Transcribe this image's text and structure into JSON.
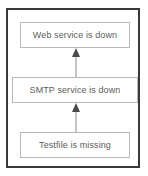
{
  "diagram": {
    "type": "fault-propagation-chain",
    "direction": "bottom-to-top",
    "frame_color": "#3a3a3a",
    "node_border_color": "#b9b9b9",
    "node_text_color": "#5d5d5d",
    "background_color": "#ffffff",
    "nodes": [
      {
        "id": "web",
        "label": "Web service is down",
        "position": "top"
      },
      {
        "id": "smtp",
        "label": "SMTP service is down",
        "position": "middle"
      },
      {
        "id": "testfile",
        "label": "Testfile is missing",
        "position": "bottom"
      }
    ],
    "connectors": [
      {
        "id": "smtp-to-web",
        "from": "smtp",
        "to": "web",
        "style": "arrow-up"
      },
      {
        "id": "testfile-to-smtp",
        "from": "testfile",
        "to": "smtp",
        "style": "arrow-up"
      }
    ]
  }
}
